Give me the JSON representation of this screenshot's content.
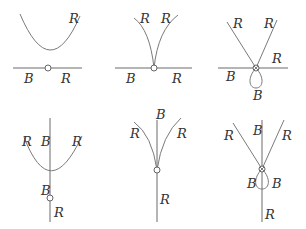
{
  "panels": [
    {
      "id": "top-left",
      "description": "parabola above horizontal line, node on line",
      "labels": [
        {
          "text": "R",
          "x": 69,
          "y": 12
        },
        {
          "text": "B",
          "x": 24,
          "y": 72
        },
        {
          "text": "R",
          "x": 61,
          "y": 72
        }
      ]
    },
    {
      "id": "top-middle",
      "description": "two branches meeting in cusp at node on horizontal line",
      "labels": [
        {
          "text": "R",
          "x": 140,
          "y": 12
        },
        {
          "text": "R",
          "x": 161,
          "y": 12
        },
        {
          "text": "B",
          "x": 126,
          "y": 72
        },
        {
          "text": "R",
          "x": 172,
          "y": 72
        }
      ]
    },
    {
      "id": "top-right",
      "description": "two straight lines crossing at node on horizontal line, loop below",
      "labels": [
        {
          "text": "R",
          "x": 233,
          "y": 17
        },
        {
          "text": "R",
          "x": 264,
          "y": 17
        },
        {
          "text": "R",
          "x": 272,
          "y": 52
        },
        {
          "text": "B",
          "x": 226,
          "y": 70
        },
        {
          "text": "B",
          "x": 253,
          "y": 89
        }
      ]
    },
    {
      "id": "bottom-left",
      "description": "parabola crossing vertical line, node below vertex",
      "labels": [
        {
          "text": "R",
          "x": 22,
          "y": 135
        },
        {
          "text": "B",
          "x": 41,
          "y": 135
        },
        {
          "text": "R",
          "x": 72,
          "y": 135
        },
        {
          "text": "B",
          "x": 41,
          "y": 184
        },
        {
          "text": "R",
          "x": 54,
          "y": 206
        }
      ]
    },
    {
      "id": "bottom-middle",
      "description": "two branches meeting in cusp at node on vertical line",
      "labels": [
        {
          "text": "B",
          "x": 156,
          "y": 110
        },
        {
          "text": "R",
          "x": 130,
          "y": 127
        },
        {
          "text": "R",
          "x": 177,
          "y": 127
        },
        {
          "text": "R",
          "x": 160,
          "y": 193
        }
      ]
    },
    {
      "id": "bottom-right",
      "description": "two straight lines crossing at node on vertical line, loop below with B labels",
      "labels": [
        {
          "text": "R",
          "x": 224,
          "y": 129
        },
        {
          "text": "B",
          "x": 253,
          "y": 124
        },
        {
          "text": "R",
          "x": 282,
          "y": 129
        },
        {
          "text": "B",
          "x": 247,
          "y": 177
        },
        {
          "text": "B",
          "x": 272,
          "y": 177
        },
        {
          "text": "R",
          "x": 265,
          "y": 208
        }
      ]
    }
  ]
}
